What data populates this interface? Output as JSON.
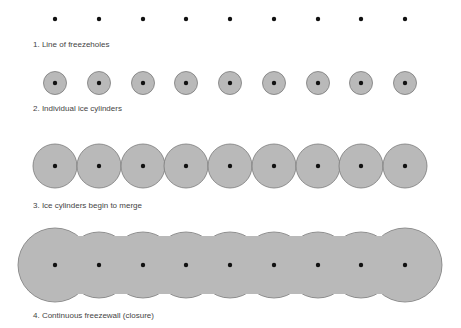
{
  "colors": {
    "ice_fill": "#b9b9b9",
    "ice_stroke": "#7a7a7a",
    "hole": "#111111"
  },
  "freezehole_x": [
    55,
    99,
    143,
    186,
    230,
    274,
    318,
    361,
    405
  ],
  "stages": [
    {
      "label": "1. Line of freezeholes",
      "y": 19,
      "radius": 0
    },
    {
      "label": "2. Individual ice cylinders",
      "y": 83,
      "radius": 11.5
    },
    {
      "label": "3. Ice cylinders begin to merge",
      "y": 166,
      "radius": 22
    },
    {
      "label": "4. Continuous freezewall (closure)",
      "y": 265,
      "radius": 33
    }
  ]
}
